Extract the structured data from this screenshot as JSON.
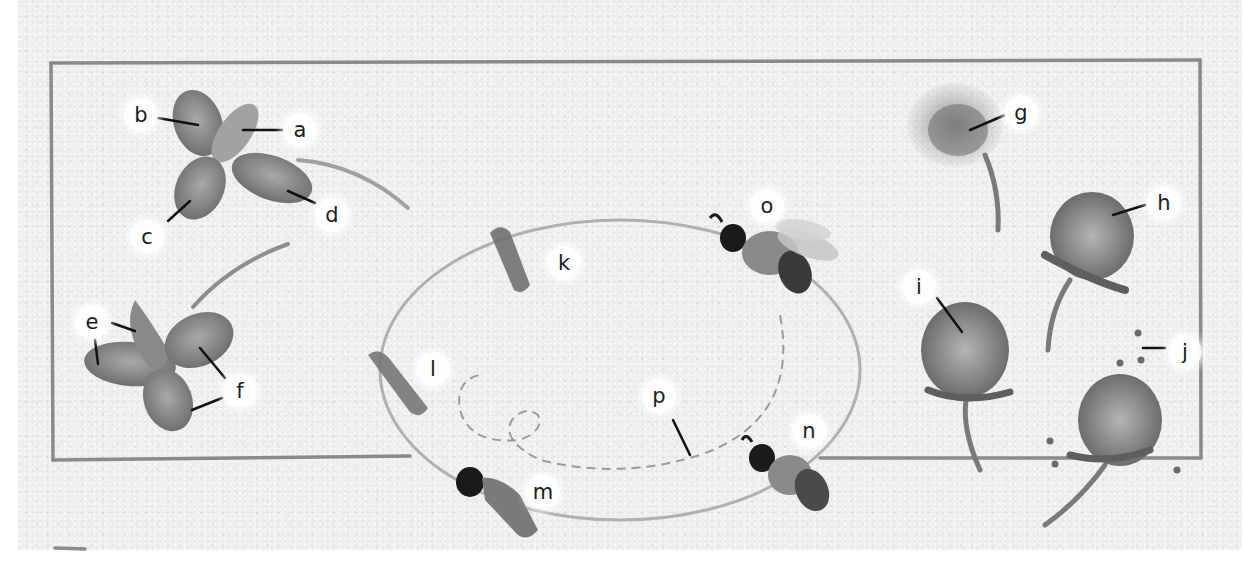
{
  "diagram": {
    "type": "labeled-illustration",
    "colors": {
      "paper": "#efefed",
      "frame": "#8a8a8a",
      "leaf": "#7d7d7d",
      "flower": "#6e6e6e",
      "cycle_path": "#a6a6a6",
      "bee_head": "#1a1a1a",
      "leader_line": "#111111"
    },
    "labels": {
      "a": "a",
      "b": "b",
      "c": "c",
      "d": "d",
      "e": "e",
      "f": "f",
      "g": "g",
      "h": "h",
      "i": "i",
      "j": "j",
      "k": "k",
      "l": "l",
      "m": "m",
      "n": "n",
      "o": "o",
      "p": "p"
    },
    "groups": [
      {
        "name": "upper-left leaf",
        "labels": [
          "a",
          "b",
          "c",
          "d"
        ]
      },
      {
        "name": "lower-left leaf",
        "labels": [
          "e",
          "f"
        ]
      },
      {
        "name": "bee cycle ellipse",
        "labels": [
          "k",
          "l",
          "m",
          "n",
          "o",
          "p"
        ]
      },
      {
        "name": "clover flower heads",
        "labels": [
          "g",
          "h",
          "i",
          "j"
        ]
      }
    ]
  }
}
